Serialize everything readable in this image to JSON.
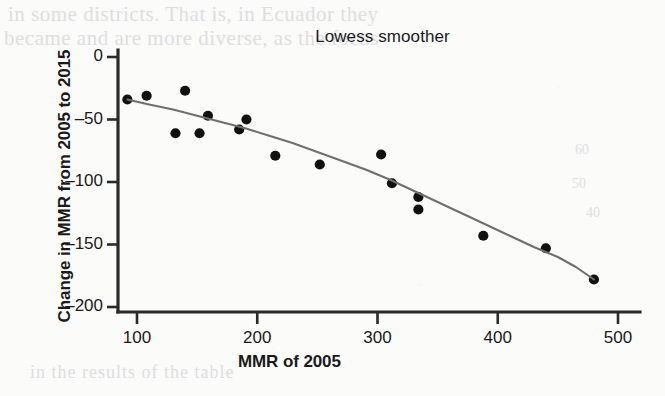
{
  "chart_data": {
    "type": "scatter",
    "title": "Lowess smoother",
    "xlabel": "MMR of 2005",
    "ylabel": "Change in MMR from 2005 to 2015",
    "xlim": [
      80,
      515
    ],
    "ylim": [
      -205,
      5
    ],
    "xticks": [
      100,
      200,
      300,
      400,
      500
    ],
    "xtick_labels": [
      "100",
      "200",
      "300",
      "400",
      "500"
    ],
    "yticks": [
      0,
      -50,
      -100,
      -150,
      -200
    ],
    "ytick_labels": [
      "0",
      "–50",
      "–100",
      "–150",
      "–200"
    ],
    "grid": false,
    "legend": null,
    "marker_color": "#111111",
    "line_color": "#6f6f6f",
    "axis_color": "#2a2a2a",
    "series": [
      {
        "name": "Countries",
        "type": "scatter",
        "points": [
          {
            "x": 92,
            "y": -34
          },
          {
            "x": 108,
            "y": -31
          },
          {
            "x": 132,
            "y": -61
          },
          {
            "x": 140,
            "y": -27
          },
          {
            "x": 152,
            "y": -61
          },
          {
            "x": 159,
            "y": -47
          },
          {
            "x": 185,
            "y": -58
          },
          {
            "x": 191,
            "y": -50
          },
          {
            "x": 215,
            "y": -79
          },
          {
            "x": 252,
            "y": -86
          },
          {
            "x": 303,
            "y": -78
          },
          {
            "x": 312,
            "y": -101
          },
          {
            "x": 334,
            "y": -112
          },
          {
            "x": 334,
            "y": -122
          },
          {
            "x": 388,
            "y": -143
          },
          {
            "x": 440,
            "y": -153
          },
          {
            "x": 480,
            "y": -178
          }
        ]
      },
      {
        "name": "Lowess smoother",
        "type": "line",
        "points": [
          {
            "x": 92,
            "y": -34
          },
          {
            "x": 110,
            "y": -38
          },
          {
            "x": 130,
            "y": -42
          },
          {
            "x": 150,
            "y": -47
          },
          {
            "x": 170,
            "y": -52
          },
          {
            "x": 190,
            "y": -57
          },
          {
            "x": 210,
            "y": -63
          },
          {
            "x": 230,
            "y": -69
          },
          {
            "x": 250,
            "y": -76
          },
          {
            "x": 270,
            "y": -83
          },
          {
            "x": 290,
            "y": -90
          },
          {
            "x": 310,
            "y": -98
          },
          {
            "x": 330,
            "y": -107
          },
          {
            "x": 350,
            "y": -116
          },
          {
            "x": 370,
            "y": -125
          },
          {
            "x": 390,
            "y": -134
          },
          {
            "x": 410,
            "y": -143
          },
          {
            "x": 430,
            "y": -152
          },
          {
            "x": 450,
            "y": -160
          },
          {
            "x": 465,
            "y": -168
          },
          {
            "x": 480,
            "y": -178
          }
        ]
      }
    ]
  },
  "ghost_text": {
    "top_line_1": "in some districts. That is, in Ecuador they",
    "top_line_2": "became and are more diverse, as the focus",
    "right_1": "60",
    "right_2": "50",
    "right_3": "40",
    "bottom": "in the results of the table",
    "mid": "ghost"
  }
}
